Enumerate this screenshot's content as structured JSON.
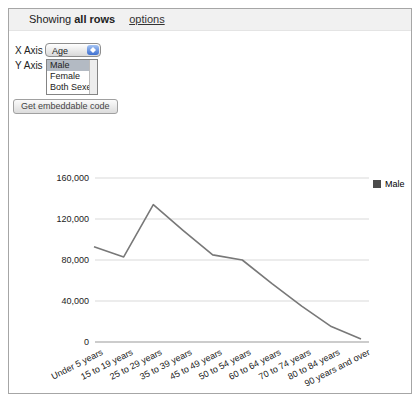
{
  "header": {
    "showing_prefix": "Showing",
    "showing_bold": "all rows",
    "options_label": "options"
  },
  "controls": {
    "x_axis_label": "X Axis",
    "x_axis_value": "Age",
    "y_axis_label": "Y Axis",
    "y_axis_options": [
      {
        "label": "Male",
        "selected": true
      },
      {
        "label": "Female",
        "selected": false
      },
      {
        "label": "Both Sexes",
        "selected": false
      }
    ],
    "embed_button_label": "Get embeddable code"
  },
  "chart_data": {
    "type": "line",
    "title": "",
    "xlabel": "",
    "ylabel": "",
    "categories": [
      "Under 5 years",
      "15 to 19 years",
      "25 to 29 years",
      "35 to 39 years",
      "45 to 49 years",
      "50 to 54 years",
      "60 to 64 years",
      "70 to 74 years",
      "80 to 84 years",
      "90 years and over"
    ],
    "series": [
      {
        "name": "Male",
        "color": "#787878",
        "values": [
          93000,
          83000,
          134000,
          109000,
          85000,
          80000,
          57000,
          35000,
          15000,
          3000
        ]
      }
    ],
    "ylim": [
      0,
      160000
    ],
    "ytick_interval": 40000,
    "ytick_labels": [
      "0",
      "40,000",
      "80,000",
      "120,000",
      "160,000"
    ],
    "grid": true,
    "gridline_color": "#d9d9d9",
    "zeroline_color": "#999999",
    "legend_position": "right",
    "legend": {
      "label": "Male",
      "swatch_color": "#4b4b4b"
    }
  }
}
